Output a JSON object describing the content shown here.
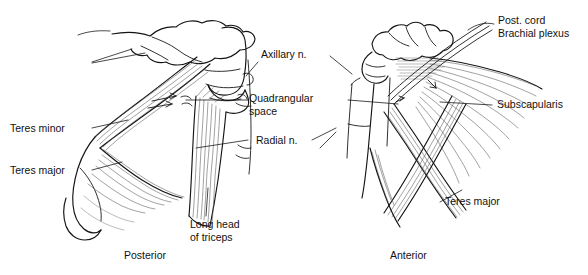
{
  "figure": {
    "views": [
      {
        "id": "posterior",
        "caption": "Posterior"
      },
      {
        "id": "anterior",
        "caption": "Anterior"
      }
    ],
    "labels": {
      "axillary_nerve": "Axillary n.",
      "quadrangular_space_line1": "Quadrangular",
      "quadrangular_space_line2": "space",
      "radial_nerve": "Radial n.",
      "teres_minor": "Teres minor",
      "teres_major_left": "Teres major",
      "long_head_line1": "Long head",
      "long_head_line2": "of triceps",
      "post_cord": "Post. cord",
      "brachial_plexus": "Brachial plexus",
      "subscapularis": "Subscapularis",
      "teres_major_right": "Teres major"
    },
    "colors": {
      "ink": "#1a1a1a",
      "hatch": "#555555",
      "background": "#ffffff"
    }
  }
}
